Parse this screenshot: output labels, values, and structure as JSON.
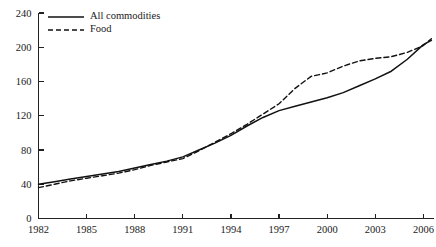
{
  "chart_data": {
    "type": "line",
    "title": "",
    "subtitle": "",
    "xlabel": "",
    "ylabel": "",
    "xlim": [
      1982,
      2006.6
    ],
    "ylim": [
      0,
      240
    ],
    "grid": false,
    "legend_position": "top-left",
    "y_ticks": [
      0,
      40,
      80,
      120,
      160,
      200,
      240
    ],
    "y_tick_labels": [
      "0",
      "40",
      "80",
      "120",
      "160",
      "200",
      "240"
    ],
    "x_ticks": [
      1982,
      1985,
      1988,
      1991,
      1994,
      1997,
      2000,
      2003,
      2006
    ],
    "x_tick_labels": [
      "1982",
      "1985",
      "1988",
      "1991",
      "1994",
      "1997",
      "2000",
      "2003",
      "2006"
    ],
    "x": [
      1982,
      1983,
      1984,
      1985,
      1986,
      1987,
      1988,
      1989,
      1990,
      1991,
      1992,
      1993,
      1994,
      1995,
      1996,
      1997,
      1998,
      1999,
      2000,
      2001,
      2002,
      2003,
      2004,
      2005,
      2006,
      2006.5
    ],
    "series": [
      {
        "name": "All commodities",
        "style": "solid",
        "color": "#111111",
        "values": [
          40,
          43,
          46,
          49,
          52,
          55,
          59,
          63,
          67,
          72,
          80,
          88,
          97,
          108,
          118,
          126,
          131,
          136,
          141,
          147,
          155,
          163,
          172,
          186,
          203,
          208
        ]
      },
      {
        "name": "Food",
        "style": "dashed",
        "color": "#111111",
        "values": [
          36,
          40,
          44,
          47,
          50,
          53,
          57,
          62,
          66,
          70,
          79,
          89,
          99,
          110,
          122,
          134,
          152,
          166,
          170,
          178,
          184,
          187,
          189,
          194,
          202,
          210
        ]
      }
    ]
  },
  "legend": {
    "items": [
      {
        "label": "All commodities",
        "style": "solid"
      },
      {
        "label": "Food",
        "style": "dashed"
      }
    ]
  }
}
